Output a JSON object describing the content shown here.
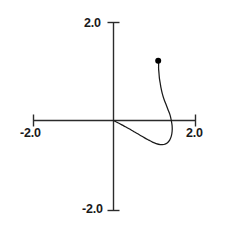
{
  "chart_data": {
    "type": "line",
    "title": "",
    "subtitle": "",
    "xlabel": "",
    "ylabel": "",
    "xlim": [
      -2.0,
      2.0
    ],
    "ylim": [
      -2.0,
      2.0
    ],
    "grid": false,
    "legend": null,
    "axes_style": "centered-cross-spines",
    "xticks": [
      -2.0,
      2.0
    ],
    "yticks": [
      -2.0,
      2.0
    ],
    "xtick_labels": [
      "-2.0",
      "2.0"
    ],
    "ytick_labels": [
      "-2.0",
      "2.0"
    ],
    "series": [
      {
        "name": "trajectory",
        "color": "#1a1a1a",
        "linewidth": 1,
        "x": [
          0.0,
          0.12,
          0.25,
          0.38,
          0.5,
          0.63,
          0.75,
          0.86,
          0.95,
          1.04,
          1.14,
          1.23,
          1.31,
          1.37,
          1.41,
          1.43,
          1.43,
          1.41,
          1.38,
          1.33,
          1.28,
          1.23,
          1.19,
          1.16,
          1.14,
          1.12,
          1.11,
          1.1,
          1.1,
          1.09
        ],
        "y": [
          0.0,
          -0.05,
          -0.11,
          -0.17,
          -0.23,
          -0.29,
          -0.35,
          -0.4,
          -0.44,
          -0.47,
          -0.49,
          -0.49,
          -0.46,
          -0.4,
          -0.32,
          -0.22,
          -0.11,
          0.0,
          0.11,
          0.22,
          0.33,
          0.44,
          0.55,
          0.66,
          0.76,
          0.86,
          0.96,
          1.06,
          1.15,
          1.22
        ]
      }
    ],
    "markers": [
      {
        "name": "endpoint-dot",
        "x": 1.09,
        "y": 1.22,
        "style": "filled-circle",
        "color": "#000000",
        "size_px": 6
      }
    ]
  },
  "labels": {
    "y_top": "2.0",
    "y_bottom": "-2.0",
    "x_left": "-2.0",
    "x_right": "2.0"
  },
  "colors": {
    "axis": "#2b2b2b",
    "curve": "#1a1a1a",
    "marker": "#000000",
    "text": "#1a1a1a",
    "background": "#ffffff"
  }
}
